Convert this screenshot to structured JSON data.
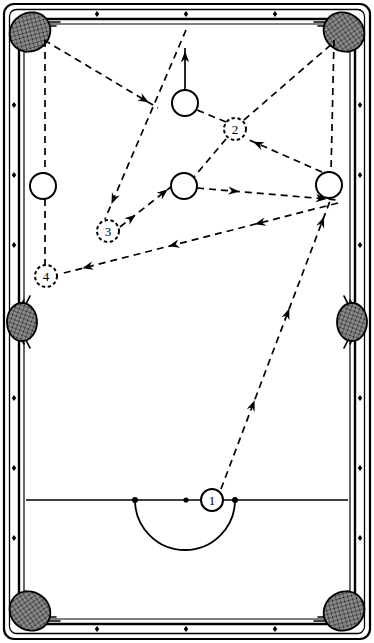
{
  "diagram": {
    "surface_color": "#ffffff",
    "line_color": "#000000",
    "rail_color": "#000000",
    "pocket_fill": "#2a2a2a"
  },
  "table": {
    "outer": {
      "x": 4,
      "y": 4,
      "width": 366,
      "height": 635
    },
    "rail_outer": {
      "x": 10,
      "y": 10,
      "width": 354,
      "height": 623
    },
    "rail_inner": {
      "x": 22,
      "y": 22,
      "width": 330,
      "height": 599
    },
    "cushion": {
      "x": 26,
      "y": 26,
      "width": 322,
      "height": 591
    },
    "head_string_y": 500,
    "d_arc": {
      "left_x": 135,
      "right_x": 235,
      "center_x": 185,
      "radius": 50
    },
    "head_spot": {
      "x": 186,
      "y": 500
    }
  },
  "pockets": [
    {
      "name": "top-left-corner-pocket",
      "cx": 30,
      "cy": 32,
      "rx": 21,
      "ry": 19,
      "angle": -35
    },
    {
      "name": "top-right-corner-pocket",
      "cx": 344,
      "cy": 32,
      "rx": 21,
      "ry": 19,
      "angle": 35
    },
    {
      "name": "left-side-pocket",
      "cx": 22,
      "cy": 322,
      "rx": 15,
      "ry": 19,
      "angle": 0
    },
    {
      "name": "right-side-pocket",
      "cx": 352,
      "cy": 322,
      "rx": 15,
      "ry": 19,
      "angle": 0
    },
    {
      "name": "bottom-left-corner-pocket",
      "cx": 30,
      "cy": 611,
      "rx": 21,
      "ry": 19,
      "angle": 35
    },
    {
      "name": "bottom-right-corner-pocket",
      "cx": 344,
      "cy": 611,
      "rx": 21,
      "ry": 19,
      "angle": -35
    }
  ],
  "diamonds": {
    "top": [
      {
        "x": 97,
        "y": 14
      },
      {
        "x": 186,
        "y": 14
      },
      {
        "x": 275,
        "y": 14
      }
    ],
    "bottom": [
      {
        "x": 97,
        "y": 629
      },
      {
        "x": 186,
        "y": 629
      },
      {
        "x": 275,
        "y": 629
      }
    ],
    "left": [
      {
        "x": 14,
        "y": 105
      },
      {
        "x": 14,
        "y": 175
      },
      {
        "x": 14,
        "y": 245
      },
      {
        "x": 14,
        "y": 398
      },
      {
        "x": 14,
        "y": 468
      },
      {
        "x": 14,
        "y": 538
      }
    ],
    "right": [
      {
        "x": 360,
        "y": 105
      },
      {
        "x": 360,
        "y": 175
      },
      {
        "x": 360,
        "y": 245
      },
      {
        "x": 360,
        "y": 398
      },
      {
        "x": 360,
        "y": 468
      },
      {
        "x": 360,
        "y": 538
      }
    ]
  },
  "balls": [
    {
      "id": "cue-ball-top",
      "name": "cue-ball-position-top",
      "cx": 185,
      "cy": 103,
      "r": 13,
      "style": "solid",
      "label": ""
    },
    {
      "id": "cue-ball-center",
      "name": "cue-ball-position-center",
      "cx": 184,
      "cy": 186,
      "r": 13,
      "style": "solid",
      "label": ""
    },
    {
      "id": "cue-ball-left",
      "name": "cue-ball-position-left",
      "cx": 43,
      "cy": 186,
      "r": 13,
      "style": "solid",
      "label": ""
    },
    {
      "id": "cue-ball-right",
      "name": "cue-ball-position-right",
      "cx": 329,
      "cy": 185,
      "r": 13,
      "style": "solid",
      "label": ""
    }
  ],
  "numbered_positions": [
    {
      "id": "pos-1",
      "name": "ball-position-1",
      "cx": 212,
      "cy": 500,
      "r": 11,
      "style": "solid",
      "label": "1"
    },
    {
      "id": "pos-2",
      "name": "ball-position-2",
      "cx": 235,
      "cy": 129,
      "r": 11,
      "style": "dashed",
      "label": "2"
    },
    {
      "id": "pos-3",
      "name": "ball-position-3",
      "cx": 108,
      "cy": 231,
      "r": 11,
      "style": "dashed",
      "label": "3"
    },
    {
      "id": "pos-4",
      "name": "ball-position-4",
      "cx": 46,
      "cy": 276,
      "r": 11,
      "style": "dashed",
      "label": "4"
    }
  ],
  "paths": [
    {
      "name": "path-1-to-right-ball",
      "style": "dashed",
      "arrows": 3,
      "points": [
        [
          221,
          489
        ],
        [
          333,
          193
        ]
      ]
    },
    {
      "name": "path-right-ball-to-2",
      "style": "dashed",
      "arrows": 1,
      "points": [
        [
          322,
          172
        ],
        [
          247,
          139
        ]
      ]
    },
    {
      "name": "path-2-to-center-ball",
      "style": "dashed",
      "arrows": 0,
      "points": [
        [
          226,
          139
        ],
        [
          194,
          177
        ]
      ]
    },
    {
      "name": "path-2-to-top-ball",
      "style": "dashed",
      "arrows": 0,
      "points": [
        [
          226,
          122
        ],
        [
          197,
          110
        ]
      ]
    },
    {
      "name": "path-2-to-top-right-pocket",
      "style": "dashed",
      "arrows": 0,
      "points": [
        [
          244,
          120
        ],
        [
          334,
          42
        ]
      ]
    },
    {
      "name": "path-center-ball-to-right",
      "style": "dashed",
      "arrows": 2,
      "points": [
        [
          197,
          188
        ],
        [
          338,
          200
        ]
      ]
    },
    {
      "name": "path-right-to-4",
      "style": "dashed",
      "arrows": 3,
      "points": [
        [
          338,
          203
        ],
        [
          60,
          274
        ]
      ]
    },
    {
      "name": "path-3-to-center-ball",
      "style": "dashed",
      "arrows": 2,
      "points": [
        [
          120,
          227
        ],
        [
          172,
          186
        ]
      ]
    },
    {
      "name": "path-topleft-pocket-to-3",
      "style": "dashed",
      "arrows": 1,
      "points": [
        [
          44,
          40
        ],
        [
          158,
          108
        ]
      ]
    },
    {
      "name": "path-3-diag-up",
      "style": "dashed",
      "arrows": 1,
      "points": [
        [
          186,
          30
        ],
        [
          105,
          219
        ]
      ]
    },
    {
      "name": "path-top-ball-to-rail",
      "style": "solid",
      "arrows": 1,
      "points": [
        [
          185,
          90
        ],
        [
          185,
          48
        ]
      ]
    },
    {
      "name": "path-4-guide-vertical",
      "style": "dashed",
      "arrows": 0,
      "points": [
        [
          45,
          199
        ],
        [
          45,
          265
        ]
      ]
    },
    {
      "name": "path-left-ball-guide-up",
      "style": "dashed",
      "arrows": 0,
      "points": [
        [
          45,
          40
        ],
        [
          45,
          173
        ]
      ]
    },
    {
      "name": "path-right-ball-guide-up",
      "style": "dashed",
      "arrows": 0,
      "points": [
        [
          334,
          40
        ],
        [
          331,
          172
        ]
      ]
    }
  ],
  "legend": {
    "ball_labels": [
      "1",
      "2",
      "3",
      "4"
    ],
    "note": ""
  }
}
